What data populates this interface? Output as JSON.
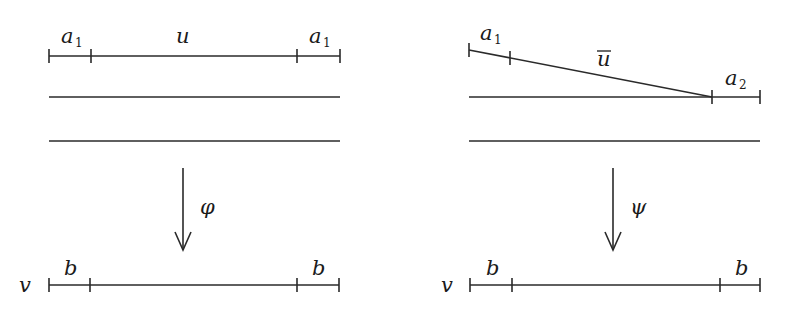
{
  "diagram": {
    "left": {
      "top_segment": {
        "labels": {
          "left_end": "a",
          "left_end_sub": "1",
          "middle": "u",
          "right_end": "a",
          "right_end_sub": "1"
        }
      },
      "arrow_label": "φ",
      "bottom_segment": {
        "name_label": "v",
        "labels": {
          "left_end": "b",
          "right_end": "b"
        }
      }
    },
    "right": {
      "slanted_segment": {
        "labels": {
          "left_end": "a",
          "left_end_sub": "1",
          "middle": "u̅"
        }
      },
      "end_label": {
        "text": "a",
        "sub": "2"
      },
      "arrow_label": "ψ",
      "bottom_segment": {
        "name_label": "v",
        "labels": {
          "left_end": "b",
          "right_end": "b"
        }
      }
    },
    "colors": {
      "stroke": "#2a2a2a",
      "background": "#ffffff"
    }
  }
}
